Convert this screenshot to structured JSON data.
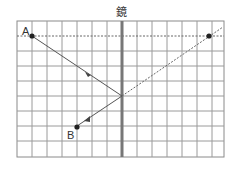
{
  "diagram": {
    "mirror_label": "鏡",
    "point_a_label": "A",
    "point_b_label": "B",
    "grid": {
      "cols": 14,
      "rows": 9,
      "cell": 14.8
    },
    "colors": {
      "grid": "#8a8a8a",
      "mirror": "#777777",
      "ray": "#555555",
      "point": "#222222"
    }
  }
}
